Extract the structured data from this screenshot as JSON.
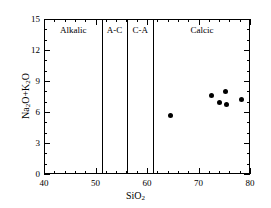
{
  "chart_data": {
    "type": "scatter",
    "title": "",
    "xlabel": "SiO2",
    "xlabel_parts": {
      "pre": "SiO",
      "sub": "2",
      "post": ""
    },
    "ylabel": "Na2O+K2O",
    "ylabel_parts": {
      "a": "Na",
      "a_sub": "2",
      "b": "O+K",
      "b_sub": "2",
      "c": "O"
    },
    "xlim": [
      40,
      80
    ],
    "ylim": [
      0,
      15
    ],
    "xticks": [
      40,
      50,
      60,
      70,
      80
    ],
    "yticks": [
      0,
      3,
      6,
      9,
      12,
      15
    ],
    "xtick_labels": [
      "40",
      "50",
      "60",
      "70",
      "80"
    ],
    "ytick_labels": [
      "0",
      "3",
      "6",
      "9",
      "12",
      "15"
    ],
    "x_minor_interval": 2,
    "y_minor_interval": 1,
    "grid": false,
    "legend": "none",
    "marker": "filled-circle",
    "marker_color": "#000000",
    "series": [
      {
        "name": "samples",
        "points": [
          {
            "x": 64.3,
            "y": 5.8
          },
          {
            "x": 72.4,
            "y": 7.65
          },
          {
            "x": 73.8,
            "y": 7.0
          },
          {
            "x": 75.0,
            "y": 8.05
          },
          {
            "x": 75.2,
            "y": 6.8
          },
          {
            "x": 78.2,
            "y": 7.3
          }
        ]
      }
    ],
    "dividers": [
      {
        "x": 51,
        "label": "Alkalic"
      },
      {
        "x": 56,
        "label": "A-C"
      },
      {
        "x": 61,
        "label": "C-A"
      }
    ],
    "regions": [
      {
        "label": "Alkalic",
        "x_start": 40,
        "x_end": 51
      },
      {
        "label": "A-C",
        "x_start": 51,
        "x_end": 56
      },
      {
        "label": "C-A",
        "x_start": 56,
        "x_end": 61
      },
      {
        "label": "Calcic",
        "x_start": 61,
        "x_end": 80
      }
    ],
    "region_label_y": 14.0,
    "axis_color": "#000000",
    "background_color": "#ffffff"
  }
}
